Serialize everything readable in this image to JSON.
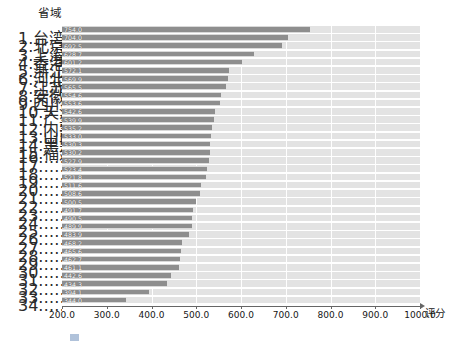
{
  "chart_data": {
    "type": "bar",
    "orientation": "horizontal",
    "title": "",
    "ylabel": "省域",
    "xlabel": "评分",
    "xlim": [
      200.0,
      1000.0
    ],
    "xticks": [
      "200.0",
      "300.0",
      "400.0",
      "500.0",
      "600.0",
      "700.0",
      "800.0",
      "900.0",
      "1000.0"
    ],
    "grid": true,
    "legend": "none",
    "bar_color": "#8e8e8e",
    "track_color": "#e3e3e3",
    "categories": [
      "1.台湾",
      "2.北京",
      "3.上海",
      "4.香港",
      "5.浙江",
      "6.河北",
      "7.江苏",
      "8.安徽",
      "9.四川",
      "10.天津",
      "11.广东",
      "12.内蒙古",
      "13.山西",
      "14.黑龙江",
      "15.福建",
      "16.……",
      "17.……",
      "18.……",
      "19.……",
      "20.……",
      "21.……",
      "22.……",
      "23.……",
      "24.……",
      "25.……",
      "26.……",
      "27.……",
      "28.……",
      "29.……",
      "30.……",
      "31.……",
      "32.……",
      "33.……",
      "34.……"
    ],
    "values": [
      754.0,
      704.0,
      692.5,
      628.7,
      601.2,
      572.1,
      569.9,
      565.5,
      554.6,
      553.6,
      542.6,
      539.9,
      535.2,
      533.0,
      530.3,
      530.2,
      527.9,
      523.4,
      521.8,
      511.6,
      508.6,
      500.5,
      491.7,
      490.5,
      489.9,
      483.9,
      468.2,
      465.6,
      462.7,
      461.1,
      442.6,
      434.3,
      394.1,
      344.0
    ],
    "value_labels": [
      "754.0",
      "704.0",
      "692.5",
      "628.7",
      "601.2",
      "572.1",
      "569.9",
      "565.5",
      "554.6",
      "553.6",
      "542.6",
      "539.9",
      "535.2",
      "533.0",
      "530.3",
      "530.2",
      "527.9",
      "523.4",
      "521.8",
      "511.6",
      "508.6",
      "500.5",
      "491.7",
      "490.5",
      "489.9",
      "483.9",
      "468.2",
      "465.6",
      "462.7",
      "461.1",
      "442.6",
      "434.3",
      "394.1",
      "344.0"
    ]
  },
  "caption": ""
}
